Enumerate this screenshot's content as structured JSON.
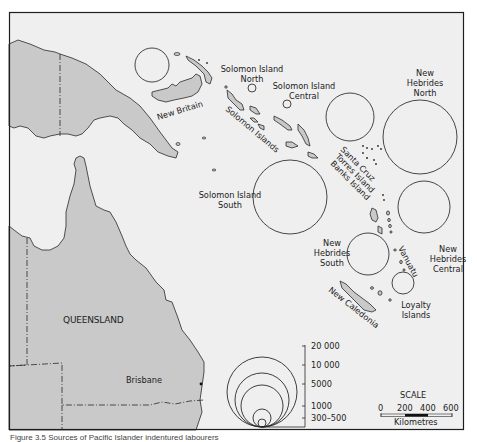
{
  "figure": {
    "caption": "Figure 3.5 Sources of Pacific Islander indentured labourers"
  },
  "colors": {
    "sea": "#efefef",
    "land": "#c9c9c9",
    "outline": "#2a2a2a",
    "frame": "#1e1e1e"
  },
  "labels": {
    "new_britain": "New Britain",
    "solomon_islands": "Solomon Islands",
    "queensland": "QUEENSLAND",
    "brisbane": "Brisbane",
    "new_caledonia": "New Caledonia",
    "vanuatu": "Vanuatu",
    "santa_cruz": "Santa Cruz",
    "torres_island": "Torres Island",
    "banks_island": "Banks Island"
  },
  "regions": [
    {
      "id": "new-britain",
      "name_lines": [],
      "cx": 152,
      "cy": 65,
      "r": 17
    },
    {
      "id": "solomon-north",
      "name_lines": [
        "Solomon Island",
        "North"
      ],
      "cx": 252,
      "cy": 88,
      "r": 4
    },
    {
      "id": "solomon-central",
      "name_lines": [
        "Solomon Island",
        "Central"
      ],
      "cx": 287,
      "cy": 104,
      "r": 4
    },
    {
      "id": "santa-cruz",
      "name_lines": [],
      "cx": 350,
      "cy": 117,
      "r": 24
    },
    {
      "id": "new-hebrides-north",
      "name_lines": [
        "New",
        "Hebrides",
        "North"
      ],
      "cx": 420,
      "cy": 137,
      "r": 37
    },
    {
      "id": "solomon-south",
      "name_lines": [
        "Solomon Island",
        "South"
      ],
      "cx": 290,
      "cy": 197,
      "r": 37
    },
    {
      "id": "new-hebrides-central",
      "name_lines": [
        "New",
        "Hebrides",
        "Central"
      ],
      "cx": 424,
      "cy": 207,
      "r": 26
    },
    {
      "id": "new-hebrides-south",
      "name_lines": [
        "New",
        "Hebrides",
        "South"
      ],
      "cx": 368,
      "cy": 254,
      "r": 21
    },
    {
      "id": "loyalty-islands",
      "name_lines": [
        "Loyalty",
        "Islands"
      ],
      "cx": 403,
      "cy": 283,
      "r": 11
    }
  ],
  "legend": {
    "values": [
      "20 000",
      "10 000",
      "5000",
      "1000",
      "300–500"
    ]
  },
  "scale": {
    "title": "SCALE",
    "ticks": [
      "0",
      "200",
      "400",
      "600"
    ],
    "unit": "Kilometres"
  }
}
